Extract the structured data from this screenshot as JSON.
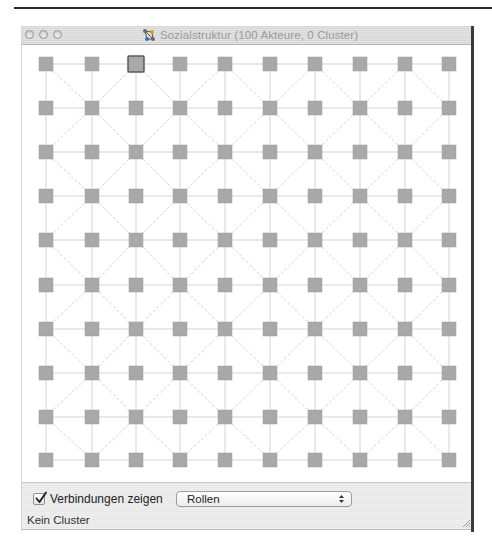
{
  "window": {
    "title": "Sozialstruktur (100 Akteure, 0 Cluster)",
    "title_icon": "network-graph-icon",
    "buttons": [
      "close",
      "minimize",
      "zoom"
    ]
  },
  "graph": {
    "actor_count": 100,
    "cluster_count": 0,
    "rows": 10,
    "cols": 10,
    "node_color": "#a8a8a8",
    "node_border_color": "#9c9c9c",
    "selected_node": {
      "row": 0,
      "col": 2,
      "border_color": "#5a5a5a"
    },
    "edge_color": "#d4d4d4",
    "col_x": [
      24,
      70,
      114,
      158,
      203,
      248,
      293,
      338,
      383,
      427
    ],
    "row_y": [
      19,
      63,
      107,
      151,
      195,
      240,
      284,
      328,
      372,
      415
    ],
    "node_size": 14
  },
  "controls": {
    "show_connections_label": "Verbindungen zeigen",
    "show_connections_checked": true,
    "color_mode_select": {
      "value": "Rollen"
    },
    "status": "Kein Cluster"
  }
}
